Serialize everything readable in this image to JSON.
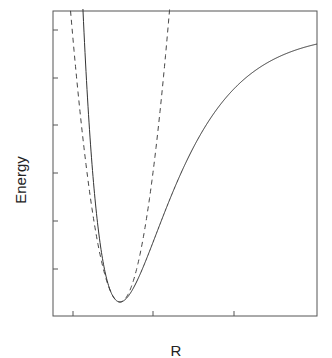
{
  "chart_data": {
    "type": "line",
    "title": "",
    "xlabel": "R",
    "ylabel": "Energy",
    "grid": false,
    "legend": null,
    "x_tick_labels": [],
    "y_tick_labels": [],
    "frame_px": {
      "left": 53,
      "top": 11,
      "right": 317,
      "bottom": 316
    },
    "x_ticks_px": [
      73,
      153,
      234
    ],
    "y_ticks_px": [
      30,
      78,
      125,
      173,
      221,
      269
    ],
    "series": [
      {
        "name": "Morse potential",
        "style": "solid",
        "color": "#333333",
        "model": "morse",
        "min_px": [
          120,
          302
        ],
        "asymptote_px": 32,
        "well_depth_px": 270,
        "a_per_px": 0.01925
      },
      {
        "name": "Harmonic approximation",
        "style": "dashed",
        "color": "#333333",
        "model": "parabola",
        "min_px": [
          120,
          302
        ],
        "k_per_px2": 0.119
      }
    ],
    "annotations": []
  }
}
